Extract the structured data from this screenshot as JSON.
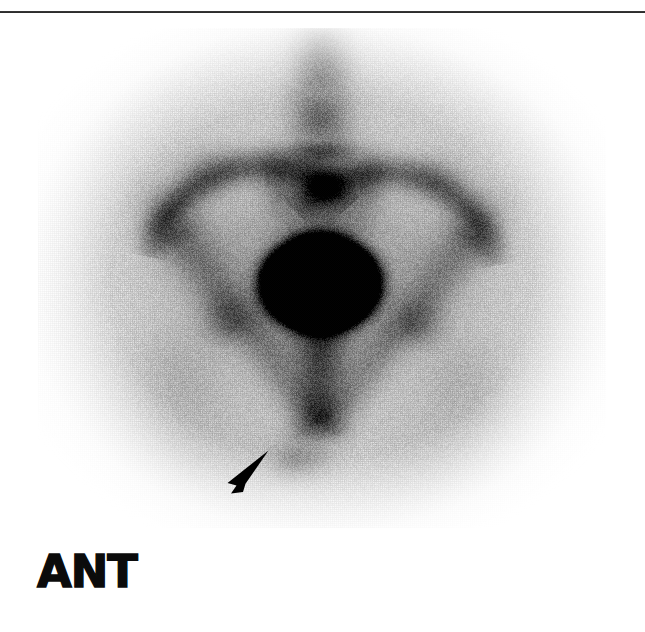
{
  "figure": {
    "modality": "bone-scintigraphy",
    "projection_label": "ANT",
    "caption_rule_color": "#2e2e2e",
    "background_color": "#ffffff"
  },
  "scan": {
    "field": {
      "x": 38,
      "y": 28,
      "width": 568,
      "height": 500
    },
    "tracer_appearance": "grayscale-inverted",
    "hot_color": "#000000",
    "cold_color": "#ffffff",
    "grain": "halftone-dither"
  },
  "annotations": {
    "orientation": {
      "label": "ANT",
      "meaning": "anterior projection",
      "color": "#0b0b0b",
      "x": 37,
      "y": 549
    },
    "arrowhead": {
      "name": "lesion-arrowhead",
      "color": "#000000",
      "tip_x": 267,
      "tip_y": 453,
      "direction": "up-right",
      "points_to": "focal-uptake-inferior-pubic-ramus"
    }
  },
  "anatomy": {
    "structures": [
      {
        "name": "lumbar-spine",
        "label": "Lumbar spine",
        "cx": 320,
        "cy": 100,
        "uptake": "moderate"
      },
      {
        "name": "sacrum",
        "label": "Sacrum",
        "cx": 320,
        "cy": 205,
        "uptake": "moderate"
      },
      {
        "name": "iliac-crest-left",
        "label": "Left iliac crest",
        "cx": 195,
        "cy": 195,
        "uptake": "high"
      },
      {
        "name": "iliac-crest-right",
        "label": "Right iliac crest",
        "cx": 455,
        "cy": 200,
        "uptake": "high"
      },
      {
        "name": "iliac-wing-left",
        "label": "Left iliac wing",
        "cx": 215,
        "cy": 245,
        "uptake": "low"
      },
      {
        "name": "iliac-wing-right",
        "label": "Right iliac wing",
        "cx": 430,
        "cy": 250,
        "uptake": "low"
      },
      {
        "name": "bladder",
        "label": "Urinary bladder",
        "cx": 320,
        "cy": 283,
        "uptake": "very-high"
      },
      {
        "name": "acetabulum-left",
        "label": "Left acetabulum",
        "cx": 215,
        "cy": 300,
        "uptake": "moderate"
      },
      {
        "name": "acetabulum-right",
        "label": "Right acetabulum",
        "cx": 425,
        "cy": 305,
        "uptake": "moderate"
      },
      {
        "name": "femoral-head-left",
        "label": "Left femoral head",
        "cx": 175,
        "cy": 345,
        "uptake": "low"
      },
      {
        "name": "femoral-head-right",
        "label": "Right femoral head",
        "cx": 465,
        "cy": 350,
        "uptake": "low"
      },
      {
        "name": "pubic-symphysis",
        "label": "Pubic symphysis",
        "cx": 320,
        "cy": 395,
        "uptake": "moderate"
      },
      {
        "name": "lesion-focus",
        "label": "Focal uptake (arrowhead)",
        "cx": 300,
        "cy": 455,
        "uptake": "moderate"
      }
    ]
  }
}
